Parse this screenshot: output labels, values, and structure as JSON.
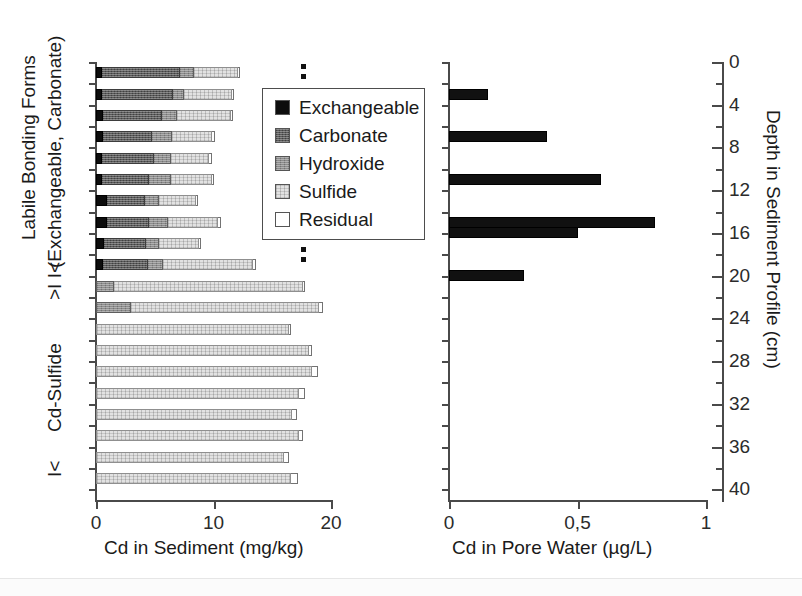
{
  "chart_data": [
    {
      "id": "sediment",
      "type": "bar",
      "orientation": "horizontal",
      "stacked": true,
      "title": "",
      "xlabel": "Cd in Sediment (mg/kg)",
      "ylabel": "Depth in Sediment Profile (cm)",
      "xlim": [
        0,
        20
      ],
      "xticks": [
        0,
        10,
        20
      ],
      "xticklabels": [
        "0",
        "10",
        "20"
      ],
      "ylim": [
        0,
        41
      ],
      "grid": false,
      "legend_position": "upper-center-right",
      "series": [
        {
          "name": "Exchangeable",
          "color": "#0d0d0d"
        },
        {
          "name": "Carbonate",
          "color": "#5a5a5a"
        },
        {
          "name": "Hydroxide",
          "color": "#8c8c8c"
        },
        {
          "name": "Sulfide",
          "color": "#e2e2e2"
        },
        {
          "name": "Residual",
          "color": "#ffffff"
        }
      ],
      "depths_cm": [
        1,
        3,
        5,
        7,
        9,
        11,
        13,
        15,
        17,
        19,
        21,
        23,
        25,
        27,
        29,
        31,
        33,
        35,
        37,
        39
      ],
      "rows": [
        {
          "depth": 1,
          "exchangeable": 0.55,
          "carbonate": 6.6,
          "hydroxide": 1.2,
          "sulfide": 3.7,
          "residual": 0.2,
          "total": 12.25
        },
        {
          "depth": 3,
          "exchangeable": 0.55,
          "carbonate": 6.0,
          "hydroxide": 0.9,
          "sulfide": 4.1,
          "residual": 0.2,
          "total": 11.75
        },
        {
          "depth": 5,
          "exchangeable": 0.6,
          "carbonate": 5.0,
          "hydroxide": 1.3,
          "sulfide": 4.6,
          "residual": 0.2,
          "total": 11.7
        },
        {
          "depth": 7,
          "exchangeable": 0.6,
          "carbonate": 4.2,
          "hydroxide": 1.7,
          "sulfide": 3.4,
          "residual": 0.2,
          "total": 10.1
        },
        {
          "depth": 9,
          "exchangeable": 0.55,
          "carbonate": 4.4,
          "hydroxide": 1.4,
          "sulfide": 3.3,
          "residual": 0.2,
          "total": 9.85
        },
        {
          "depth": 11,
          "exchangeable": 0.55,
          "carbonate": 4.0,
          "hydroxide": 1.8,
          "sulfide": 3.5,
          "residual": 0.2,
          "total": 10.05
        },
        {
          "depth": 13,
          "exchangeable": 0.9,
          "carbonate": 3.3,
          "hydroxide": 1.2,
          "sulfide": 3.1,
          "residual": 0.2,
          "total": 8.7
        },
        {
          "depth": 15,
          "exchangeable": 0.9,
          "carbonate": 3.6,
          "hydroxide": 1.6,
          "sulfide": 4.3,
          "residual": 0.2,
          "total": 10.6
        },
        {
          "depth": 17,
          "exchangeable": 0.65,
          "carbonate": 3.6,
          "hydroxide": 1.1,
          "sulfide": 3.4,
          "residual": 0.2,
          "total": 8.95
        },
        {
          "depth": 19,
          "exchangeable": 0.6,
          "carbonate": 3.8,
          "hydroxide": 1.3,
          "sulfide": 7.7,
          "residual": 0.2,
          "total": 13.6
        },
        {
          "depth": 21,
          "exchangeable": 0.0,
          "carbonate": 0.0,
          "hydroxide": 1.5,
          "sulfide": 16.1,
          "residual": 0.2,
          "total": 17.8
        },
        {
          "depth": 23,
          "exchangeable": 0.0,
          "carbonate": 0.0,
          "hydroxide": 3.0,
          "sulfide": 16.0,
          "residual": 0.3,
          "total": 19.3
        },
        {
          "depth": 25,
          "exchangeable": 0.0,
          "carbonate": 0.0,
          "hydroxide": 0.0,
          "sulfide": 16.4,
          "residual": 0.2,
          "total": 16.6
        },
        {
          "depth": 27,
          "exchangeable": 0.0,
          "carbonate": 0.0,
          "hydroxide": 0.0,
          "sulfide": 18.1,
          "residual": 0.3,
          "total": 18.4
        },
        {
          "depth": 29,
          "exchangeable": 0.0,
          "carbonate": 0.0,
          "hydroxide": 0.0,
          "sulfide": 18.4,
          "residual": 0.5,
          "total": 18.9
        },
        {
          "depth": 31,
          "exchangeable": 0.0,
          "carbonate": 0.0,
          "hydroxide": 0.0,
          "sulfide": 17.3,
          "residual": 0.5,
          "total": 17.8
        },
        {
          "depth": 33,
          "exchangeable": 0.0,
          "carbonate": 0.0,
          "hydroxide": 0.0,
          "sulfide": 16.7,
          "residual": 0.4,
          "total": 17.1
        },
        {
          "depth": 35,
          "exchangeable": 0.0,
          "carbonate": 0.0,
          "hydroxide": 0.0,
          "sulfide": 17.3,
          "residual": 0.3,
          "total": 17.6
        },
        {
          "depth": 37,
          "exchangeable": 0.0,
          "carbonate": 0.0,
          "hydroxide": 0.0,
          "sulfide": 16.0,
          "residual": 0.4,
          "total": 16.4
        },
        {
          "depth": 39,
          "exchangeable": 0.0,
          "carbonate": 0.0,
          "hydroxide": 0.0,
          "sulfide": 16.6,
          "residual": 0.6,
          "total": 17.2
        }
      ]
    },
    {
      "id": "porewater",
      "type": "bar",
      "orientation": "horizontal",
      "stacked": false,
      "title": "",
      "xlabel": "Cd in Pore Water (µg/L)",
      "ylabel": "Depth in Sediment Profile (cm)",
      "xlim": [
        0,
        1
      ],
      "xticks": [
        0,
        0.5,
        1
      ],
      "xticklabels": [
        "0",
        "0,5",
        "1"
      ],
      "ylim": [
        0,
        41
      ],
      "yticks": [
        0,
        4,
        8,
        12,
        16,
        20,
        24,
        28,
        32,
        36,
        40
      ],
      "yticklabels": [
        "0",
        "4",
        "8",
        "12",
        "16",
        "20",
        "24",
        "28",
        "32",
        "36",
        "40"
      ],
      "grid": false,
      "series": [
        {
          "name": "Cd in Pore Water",
          "color": "#111111"
        }
      ],
      "rows": [
        {
          "depth": 3,
          "value": 0.15
        },
        {
          "depth": 7,
          "value": 0.38
        },
        {
          "depth": 11,
          "value": 0.59
        },
        {
          "depth": 15,
          "value": 0.8
        },
        {
          "depth": 16,
          "value": 0.5
        },
        {
          "depth": 20,
          "value": 0.29
        }
      ]
    }
  ],
  "legend": {
    "items": [
      {
        "label": "Exchangeable",
        "key": "exchangeable"
      },
      {
        "label": "Carbonate",
        "key": "carbonate"
      },
      {
        "label": "Hydroxide",
        "key": "hydroxide"
      },
      {
        "label": "Sulfide",
        "key": "sulfide"
      },
      {
        "label": "Residual",
        "key": "residual"
      }
    ]
  },
  "left_axis_annotations": {
    "main_title": "Labile Bonding Forms",
    "subtitle": "(Exchangeable, Carbonate)",
    "bracket_top": ">I I<",
    "zone_label": "Cd-Sulfide",
    "bracket_bottom": "I<"
  },
  "left_panel": {
    "xlabel": "Cd in Sediment (mg/kg)",
    "xticklabels": [
      "0",
      "10",
      "20"
    ]
  },
  "right_panel": {
    "xlabel": "Cd in Pore Water (µg/L)",
    "xticklabels": [
      "0",
      "0,5",
      "1"
    ],
    "ylabel": "Depth in Sediment Profile (cm)",
    "yticklabels": [
      "0",
      "4",
      "8",
      "12",
      "16",
      "20",
      "24",
      "28",
      "32",
      "36",
      "40"
    ]
  }
}
